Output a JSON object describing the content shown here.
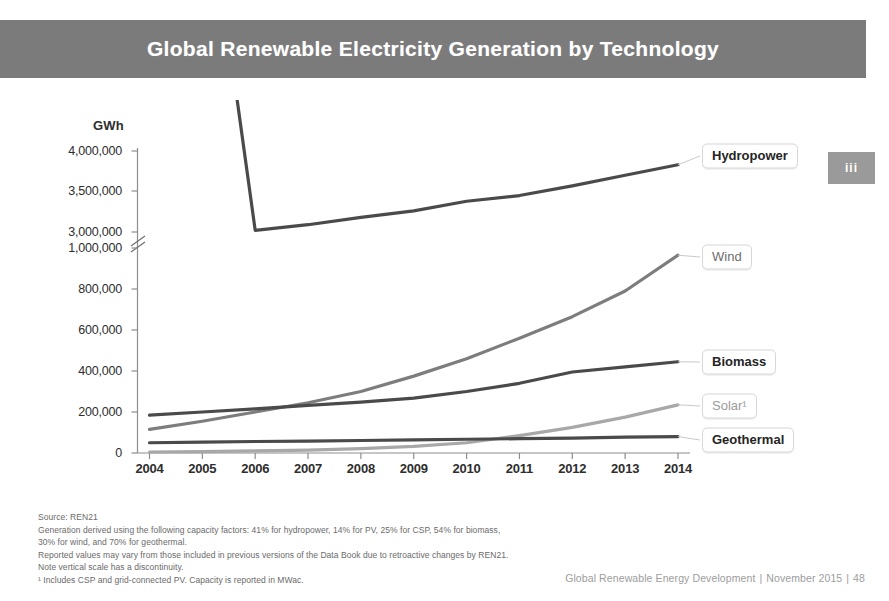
{
  "banner": {
    "title": "Global Renewable Electricity Generation by Technology",
    "background_color": "#7b7b7b",
    "text_color": "#ffffff"
  },
  "chapter_tab": {
    "label": "iii",
    "background_color": "#9a9a9a"
  },
  "chart_data": {
    "type": "line",
    "title": "Global Renewable Electricity Generation by Technology",
    "xlabel": "",
    "ylabel": "GWh",
    "y_unit_label": "GWh",
    "grid": false,
    "legend_position": "right-inline-callouts",
    "axis_discontinuity": true,
    "axis_break_note": "Vertical scale has a discontinuity between 1,000,000 and 3,000,000",
    "categories": [
      "2004",
      "2005",
      "2006",
      "2007",
      "2008",
      "2009",
      "2010",
      "2011",
      "2012",
      "2013",
      "2014"
    ],
    "x": [
      2004,
      2005,
      2006,
      2007,
      2008,
      2009,
      2010,
      2011,
      2012,
      2013,
      2014
    ],
    "y_tick_labels": [
      "4,000,000",
      "3,500,000",
      "3,000,000",
      "1,000,000",
      "800,000",
      "600,000",
      "400,000",
      "200,000",
      "0"
    ],
    "y_tick_values": [
      4000000,
      3500000,
      3000000,
      1000000,
      800000,
      600000,
      400000,
      200000,
      0
    ],
    "ylim_lower_segment": [
      0,
      1000000
    ],
    "ylim_upper_segment": [
      3000000,
      4000000
    ],
    "series": [
      {
        "name": "Hydropower",
        "color": "#4a4a4a",
        "label_style": "strong",
        "values": [
          2900000,
          2950000,
          3020000,
          3090000,
          3180000,
          3260000,
          3380000,
          3450000,
          3570000,
          3700000,
          3830000
        ]
      },
      {
        "name": "Wind",
        "color": "#7d7d7d",
        "label_style": "medium",
        "values": [
          115000,
          155000,
          200000,
          245000,
          300000,
          375000,
          460000,
          560000,
          665000,
          790000,
          965000
        ]
      },
      {
        "name": "Biomass",
        "color": "#4a4a4a",
        "label_style": "strong",
        "values": [
          185000,
          200000,
          215000,
          232000,
          248000,
          268000,
          300000,
          340000,
          395000,
          420000,
          445000
        ]
      },
      {
        "name": "Solar¹",
        "color": "#a8a8a8",
        "label_style": "light",
        "values": [
          5000,
          7000,
          10000,
          14000,
          21000,
          32000,
          50000,
          85000,
          125000,
          175000,
          235000
        ]
      },
      {
        "name": "Geothermal",
        "color": "#4a4a4a",
        "label_style": "strong",
        "values": [
          50000,
          53000,
          56000,
          58000,
          61000,
          64000,
          67000,
          70000,
          73000,
          77000,
          80000
        ]
      }
    ]
  },
  "footnotes": [
    "Source: REN21",
    "Generation derived using the following capacity factors: 41% for hydropower, 14% for PV, 25% for CSP, 54% for biomass,",
    "30% for wind, and 70% for geothermal.",
    "Reported values may vary from those included in previous versions of the Data Book due to retroactive changes by REN21.",
    "Note vertical scale has a discontinuity.",
    "¹ Includes CSP and grid-connected PV. Capacity is reported in MWac."
  ],
  "footer": {
    "document": "Global Renewable Energy Development",
    "date": "November 2015",
    "page": "48"
  }
}
